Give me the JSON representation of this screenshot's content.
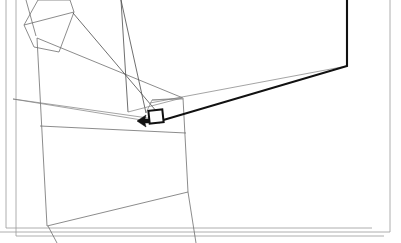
{
  "canvas": {
    "width": 401,
    "height": 243,
    "background": "#ffffff",
    "title": "Technical line drawing",
    "description": "Monochrome wireframe line drawing of a tilted rectangular panel with projection lines converging on a small highlighted rectangle, with a pointer arrow."
  },
  "palette": {
    "background": "#ffffff",
    "frame_gray": "#9a9a9a",
    "panel_gray": "#6e6e6e",
    "wire_gray": "#4a4a4a",
    "wire_light": "#7d7d7d",
    "accent_black": "#111111"
  },
  "layers": {
    "frames": {
      "name": "nested-page-frames",
      "count": 3,
      "stroke": "#9a9a9a",
      "stroke_width": 0.8,
      "paths": [
        "M 6,0 L 6,228 L 372,228",
        "M 16,0 L 16,236 L 384,236",
        "M 390,0 L 390,232 L 0,232"
      ]
    },
    "panel": {
      "name": "tilted-panel-quad",
      "stroke": "#6e6e6e",
      "stroke_width": 0.8,
      "paths": [
        "M 37,38 L 183,98 L 188,192 L 47,226 Z",
        "M 40,126 L 186,133",
        "M 36,36 L 26,0",
        "M 48,226 L 57,243",
        "M 188,192 L 196,243"
      ]
    },
    "top_quad": {
      "name": "top-left-quad",
      "stroke": "#6e6e6e",
      "stroke_width": 0.8,
      "paths": [
        "M 24,25 L 38,0 L 70,0 L 74,12 L 59,52 L 34,47 Z",
        "M 24,25 L 74,12"
      ]
    },
    "wires": {
      "name": "projection-wire-lines",
      "stroke": "#4a4a4a",
      "stroke_width": 0.8,
      "paths": [
        "M 73,13 L 157,112",
        "M 121,0 L 146,113",
        "M 121,0 L 128,112",
        "M 128,112 L 182,98",
        "M 146,113 L 152,100",
        "M 152,100 L 182,98",
        "M 152,100 L 183,99",
        "M 13,99 L 148,118",
        "M 13,99 L 160,123"
      ]
    },
    "thick_polyline": {
      "name": "highlighted-thick-polyline",
      "stroke": "#111111",
      "stroke_width": 2.1,
      "path": "M 347,0 L 347,66 L 160,121 L 152,122"
    },
    "thin_return": {
      "name": "thin-return-edge",
      "stroke": "#7d7d7d",
      "stroke_width": 0.7,
      "path": "M 347,66 L 150,103"
    },
    "detail_box": {
      "name": "highlighted-detail-rect",
      "stroke": "#111111",
      "stroke_width": 2.0,
      "fill": "#ffffff",
      "x": 149,
      "y": 110,
      "width": 14,
      "height": 13,
      "rotation_deg": -6
    },
    "cursor": {
      "name": "pointer-arrow-cursor",
      "direction": "left",
      "fill": "#111111",
      "tip_x": 137,
      "tip_y": 121,
      "path": "M 137,121 L 146,115 L 145,119 L 149,119 L 149,123 L 145,123 L 146,127 Z"
    }
  }
}
